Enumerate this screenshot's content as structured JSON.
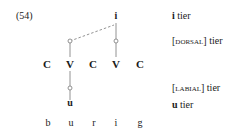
{
  "example_number": "(54)",
  "tiers": {
    "i": {
      "symbol": "i",
      "label_sym": "i",
      "label_rest": " tier"
    },
    "dorsal": {
      "open": "[",
      "feature": "dorsal",
      "close": "] tier"
    },
    "labial": {
      "open": "[",
      "feature": "labial",
      "close": "] tier"
    },
    "u": {
      "symbol": "u",
      "label_sym": "u",
      "label_rest": " tier"
    }
  },
  "skeleton": [
    "C",
    "V",
    "C",
    "V",
    "C"
  ],
  "orthography": [
    "b",
    "u",
    "r",
    "i",
    "g"
  ],
  "colors": {
    "line": "#777777",
    "text": "#1a1a1a"
  }
}
